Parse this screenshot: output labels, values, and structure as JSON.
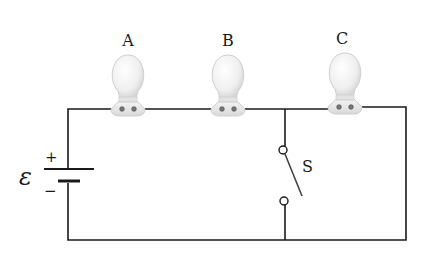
{
  "diagram": {
    "type": "circuit",
    "bulbs": [
      {
        "label": "A",
        "cx": 128
      },
      {
        "label": "B",
        "cx": 228
      },
      {
        "label": "C",
        "cx": 345
      }
    ],
    "battery": {
      "symbol": "ε",
      "plus": "+",
      "minus": "−"
    },
    "switch": {
      "label": "S",
      "state": "open"
    },
    "colors": {
      "wire": "#1a1a1a",
      "bulb": "#e9e9e9",
      "bulb_outline": "#c8c8c8"
    }
  }
}
